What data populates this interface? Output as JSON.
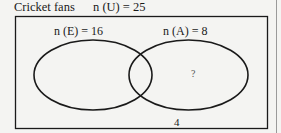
{
  "header": {
    "title": "Cricket fans",
    "universal_count": "n (U) = 25"
  },
  "sets": [
    {
      "name": "E",
      "label": "n (E) = 16"
    },
    {
      "name": "A",
      "label": "n (A) = 8"
    }
  ],
  "regions": {
    "only_a": "?",
    "outside": "4"
  },
  "colors": {
    "stroke": "#1a1a1a",
    "background": "#f4f4f2",
    "side_rule": "#9a9a9a"
  }
}
